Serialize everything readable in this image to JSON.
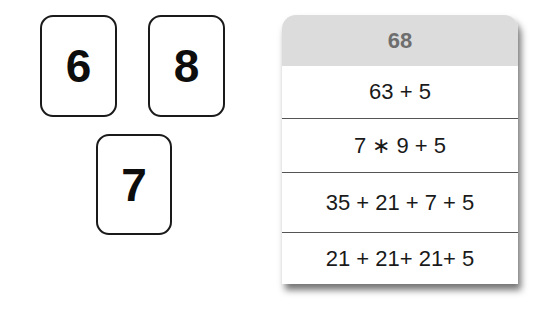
{
  "cards": [
    {
      "label": "6"
    },
    {
      "label": "8"
    },
    {
      "label": "7"
    }
  ],
  "table": {
    "header": "68",
    "rows": [
      "63 + 5",
      "7 ∗ 9 + 5",
      "35 + 21 + 7 + 5",
      "21 + 21+ 21+ 5"
    ]
  }
}
